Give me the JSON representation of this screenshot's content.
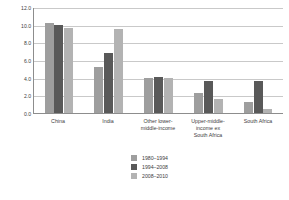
{
  "chart_data": {
    "type": "bar",
    "title": "",
    "xlabel": "",
    "ylabel": "Average annual percentage change",
    "categories": [
      "China",
      "India",
      "Other lower-middle-income",
      "Upper-middle-income ex South Africa",
      "South Africa"
    ],
    "category_lines": [
      [
        "China"
      ],
      [
        "India"
      ],
      [
        "Other lower-",
        "middle-income"
      ],
      [
        "Upper-middle-",
        "income ex",
        "South Africa"
      ],
      [
        "South Africa"
      ]
    ],
    "series": [
      {
        "name": "1980–1994",
        "color": "#9e9e9e",
        "values": [
          10.2,
          5.2,
          4.0,
          2.3,
          1.2
        ]
      },
      {
        "name": "1994–2008",
        "color": "#595959",
        "values": [
          10.0,
          6.8,
          4.1,
          3.6,
          3.6
        ]
      },
      {
        "name": "2008–2010",
        "color": "#b3b3b3",
        "values": [
          9.6,
          9.5,
          4.0,
          1.6,
          0.5
        ]
      }
    ],
    "ylim": [
      0.0,
      12.0
    ],
    "ytick_values": [
      0.0,
      2.0,
      4.0,
      6.0,
      8.0,
      10.0,
      12.0
    ],
    "ytick_labels": [
      "0.0",
      "2.0",
      "4.0",
      "6.0",
      "8.0",
      "10.0",
      "12.0"
    ],
    "grid": "horizontal",
    "legend_position": "bottom-center",
    "axis_color": "#8d8d8d",
    "grid_color": "#c9c9c9",
    "background_color": "#ffffff"
  }
}
